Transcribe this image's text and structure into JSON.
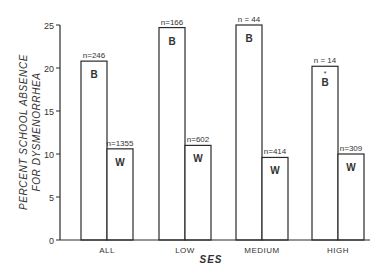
{
  "chart_data": {
    "type": "bar",
    "title": "",
    "xlabel": "SES",
    "ylabel": "PERCENT SCHOOL ABSENCE FOR DYSMENORRHEA",
    "ylabel_lines": [
      "PERCENT SCHOOL ABSENCE",
      "FOR DYSMENORRHEA"
    ],
    "ylim": [
      0,
      25
    ],
    "yticks": [
      0,
      5,
      10,
      15,
      20,
      25
    ],
    "grid": false,
    "legend": "none (bars labeled inside: B, W)",
    "categories": [
      "ALL",
      "LOW",
      "MEDIUM",
      "HIGH"
    ],
    "series": [
      {
        "name": "B",
        "values": [
          20.8,
          24.7,
          25.0,
          20.2
        ],
        "n_labels": [
          "n=246",
          "n=166",
          "n = 44",
          "n = 14"
        ],
        "bar_labels": [
          "B",
          "B",
          "B",
          "* B"
        ]
      },
      {
        "name": "W",
        "values": [
          10.6,
          11.0,
          9.6,
          10.0
        ],
        "n_labels": [
          "n=1355",
          "n=602",
          "n=414",
          "n=309"
        ],
        "bar_labels": [
          "W",
          "W",
          "W",
          "W"
        ]
      }
    ]
  }
}
